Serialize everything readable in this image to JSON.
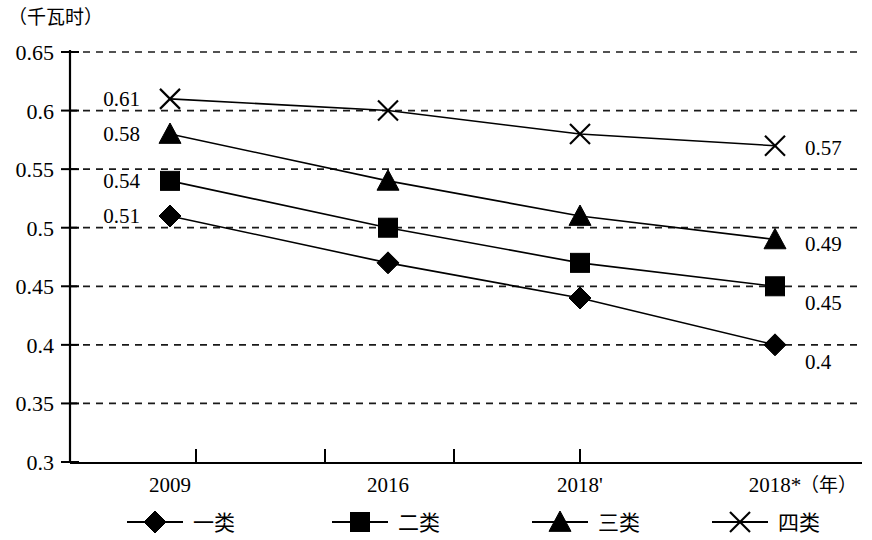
{
  "chart_data": {
    "type": "line",
    "title": "",
    "unit_label": "（千瓦时）",
    "ylabel": "（千瓦时）",
    "xlabel": "（年）",
    "categories": [
      "2009",
      "2016",
      "2018'",
      "2018*"
    ],
    "ylim": [
      0.3,
      0.65
    ],
    "ytick_labels": [
      "0.65",
      "0.6",
      "0.55",
      "0.5",
      "0.45",
      "0.4",
      "0.35",
      "0.3"
    ],
    "ytick_values": [
      0.65,
      0.6,
      0.55,
      0.5,
      0.45,
      0.4,
      0.35,
      0.3
    ],
    "grid": true,
    "grid_style": "dashed-horizontal",
    "legend_position": "bottom",
    "series": [
      {
        "name": "一类",
        "marker": "diamond",
        "values": [
          0.51,
          0.47,
          0.44,
          0.4
        ],
        "start_label": "0.51",
        "end_label": "0.4"
      },
      {
        "name": "二类",
        "marker": "square",
        "values": [
          0.54,
          0.5,
          0.47,
          0.45
        ],
        "start_label": "0.54",
        "end_label": "0.45"
      },
      {
        "name": "三类",
        "marker": "triangle",
        "values": [
          0.58,
          0.54,
          0.51,
          0.49
        ],
        "start_label": "0.58",
        "end_label": "0.49"
      },
      {
        "name": "四类",
        "marker": "cross",
        "values": [
          0.61,
          0.6,
          0.58,
          0.57
        ],
        "start_label": "0.61",
        "end_label": "0.57"
      }
    ],
    "colors": {
      "line": "#000000",
      "marker": "#000000",
      "grid": "#1a1a1a",
      "axis": "#000000",
      "background": "#ffffff"
    }
  }
}
